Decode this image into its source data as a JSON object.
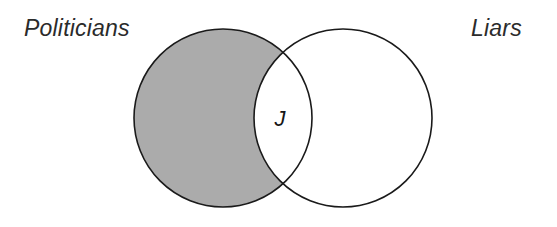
{
  "figure": {
    "type": "venn-diagram",
    "background_color": "#ffffff",
    "stroke_color": "#1a1a1a",
    "shade_color": "#ababab",
    "text_color": "#2b2b2b"
  },
  "labels": {
    "left_set": "Politicians",
    "right_set": "Liars",
    "intersection_marker": "J"
  },
  "sets": [
    {
      "id": "politicians",
      "name": "Politicians",
      "cx": 223,
      "cy": 118,
      "r": 89,
      "fill": "#ffffff",
      "stroke": "#1a1a1a"
    },
    {
      "id": "liars",
      "name": "Liars",
      "cx": 343,
      "cy": 118,
      "r": 89,
      "fill": "#ffffff",
      "stroke": "#1a1a1a"
    }
  ],
  "regions": [
    {
      "id": "politicians-only",
      "description": "Politicians who are not Liars",
      "shaded": true,
      "fill": "#ababab"
    },
    {
      "id": "intersection",
      "description": "Politicians who are Liars",
      "shaded": false,
      "fill": "#ffffff",
      "marker": "J"
    },
    {
      "id": "liars-only",
      "description": "Liars who are not Politicians",
      "shaded": false,
      "fill": "#ffffff"
    }
  ],
  "marker_position": {
    "x": 280,
    "y": 120
  }
}
